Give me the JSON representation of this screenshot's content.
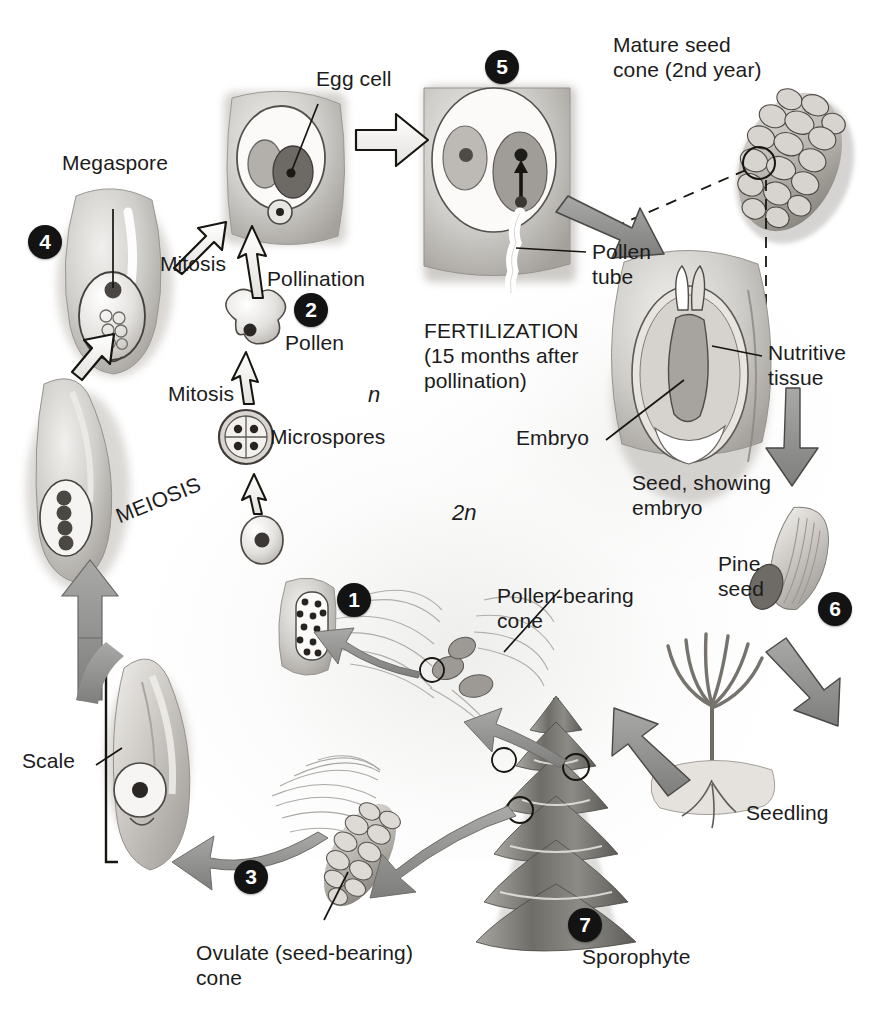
{
  "figure": {
    "accent_dark": "#131313",
    "arrow_gray": "#8d8d8d",
    "arrow_outline": "#1a1a1a",
    "text_color": "#1c1c1c"
  },
  "ploidy_labels": [
    {
      "id": "haploid",
      "text": "n"
    },
    {
      "id": "diploid",
      "text": "2n"
    }
  ],
  "steps": [
    {
      "number": "1",
      "name": "pollen-bearing-cone-step"
    },
    {
      "number": "2",
      "name": "pollen-step"
    },
    {
      "number": "3",
      "name": "ovulate-cone-step"
    },
    {
      "number": "4",
      "name": "megaspore-step"
    },
    {
      "number": "5",
      "name": "fertilization-step"
    },
    {
      "number": "6",
      "name": "pine-seed-step"
    },
    {
      "number": "7",
      "name": "sporophyte-step"
    }
  ],
  "labels": {
    "megaspore": "Megaspore",
    "egg_cell": "Egg cell",
    "mature_seed_cone": "Mature seed\ncone (2nd year)",
    "pollen_tube": "Pollen\ntube",
    "nutritive_tissue": "Nutritive\ntissue",
    "embryo": "Embryo",
    "seed_showing_embryo": "Seed, showing\nembryo",
    "pine_seed": "Pine\nseed",
    "seedling": "Seedling",
    "sporophyte": "Sporophyte",
    "pollen_bearing_cone": "Pollen-bearing\ncone",
    "ovulate_cone": "Ovulate (seed-bearing)\ncone",
    "scale": "Scale",
    "pollen": "Pollen",
    "microspores": "Microspores",
    "mitosis_upper": "Mitosis",
    "mitosis_lower": "Mitosis",
    "pollination": "Pollination",
    "meiosis": "MEIOSIS",
    "fertilization": "FERTILIZATION\n(15 months after\npollination)"
  },
  "illustrations": [
    {
      "name": "ovule-with-archegonia-and-egg",
      "caption": "Egg cell"
    },
    {
      "name": "ovule-with-megaspore",
      "caption": "Megaspore"
    },
    {
      "name": "fertilization-ovule-with-pollen-tube",
      "caption": "Pollen tube"
    },
    {
      "name": "mature-seed-cone",
      "caption": "Mature seed cone (2nd year)"
    },
    {
      "name": "seed-cross-section",
      "caption": "Seed, showing embryo"
    },
    {
      "name": "winged-pine-seed",
      "caption": "Pine seed"
    },
    {
      "name": "pine-seedling",
      "caption": "Seedling"
    },
    {
      "name": "mature-pine-tree",
      "caption": "Sporophyte"
    },
    {
      "name": "ovulate-cone-on-branch",
      "caption": "Ovulate (seed-bearing) cone"
    },
    {
      "name": "ovulate-cone-scale",
      "caption": "Scale"
    },
    {
      "name": "megasporangium-with-four-cells",
      "caption": "MEIOSIS"
    },
    {
      "name": "pollen-grain",
      "caption": "Pollen"
    },
    {
      "name": "microspore-tetrad",
      "caption": "Microspores"
    },
    {
      "name": "microsporocyte",
      "caption": ""
    },
    {
      "name": "microsporangium-with-pollen",
      "caption": ""
    },
    {
      "name": "pollen-bearing-cone-on-branch",
      "caption": "Pollen-bearing cone"
    }
  ]
}
